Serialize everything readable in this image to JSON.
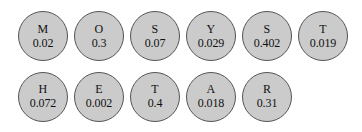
{
  "diagram": {
    "type": "node-circles",
    "background_color": "#ffffff",
    "node_fill_color": "#cbcbcb",
    "node_border_color": "#555555",
    "text_color": "#111111",
    "rows": [
      {
        "nodes": [
          {
            "letter": "M",
            "value": "0.02"
          },
          {
            "letter": "O",
            "value": "0.3"
          },
          {
            "letter": "S",
            "value": "0.07"
          },
          {
            "letter": "Y",
            "value": "0.029"
          },
          {
            "letter": "S",
            "value": "0.402"
          },
          {
            "letter": "T",
            "value": "0.019"
          }
        ]
      },
      {
        "nodes": [
          {
            "letter": "H",
            "value": "0.072"
          },
          {
            "letter": "E",
            "value": "0.002"
          },
          {
            "letter": "T",
            "value": "0.4"
          },
          {
            "letter": "A",
            "value": "0.018"
          },
          {
            "letter": "R",
            "value": "0.31"
          }
        ]
      }
    ]
  }
}
